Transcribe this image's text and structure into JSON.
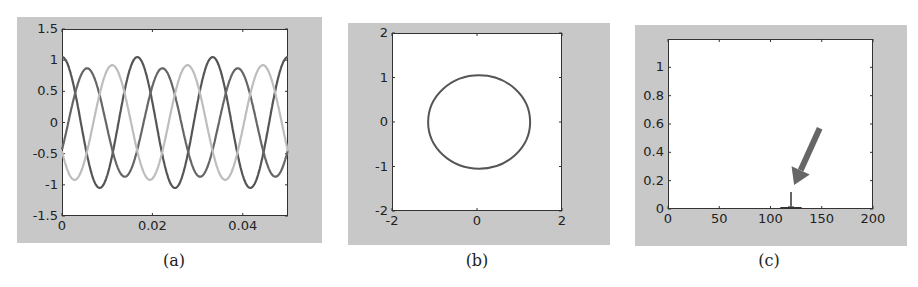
{
  "chart_data": [
    {
      "id": "a",
      "type": "line",
      "caption": "(a)",
      "title": "",
      "xlabel": "",
      "ylabel": "",
      "xlim": [
        0,
        0.05
      ],
      "ylim": [
        -1.5,
        1.5
      ],
      "x_ticks": [
        "0",
        "0.02",
        "0.04"
      ],
      "x_tick_values": [
        0,
        0.02,
        0.04
      ],
      "y_ticks": [
        "1.5",
        "1",
        "0.5",
        "0",
        "-0.5",
        "-1",
        "-1.5"
      ],
      "y_tick_values": [
        1.5,
        1,
        0.5,
        0,
        -0.5,
        -1,
        -1.5
      ],
      "grid": false,
      "series": [
        {
          "name": "phase 1",
          "color": "#555555",
          "amplitude": 1.05,
          "frequency_hz": 60,
          "phase_deg": 0
        },
        {
          "name": "phase 2",
          "color": "#666666",
          "amplitude": 0.87,
          "frequency_hz": 60,
          "phase_deg": -120
        },
        {
          "name": "phase 3",
          "color": "#bdbdbd",
          "amplitude": 0.92,
          "frequency_hz": 60,
          "phase_deg": 120
        }
      ]
    },
    {
      "id": "b",
      "type": "line",
      "caption": "(b)",
      "title": "",
      "xlabel": "",
      "ylabel": "",
      "xlim": [
        -2,
        2
      ],
      "ylim": [
        -2,
        2
      ],
      "x_ticks": [
        "-2",
        "0",
        "2"
      ],
      "x_tick_values": [
        -2,
        0,
        2
      ],
      "y_ticks": [
        "2",
        "1",
        "0",
        "-1",
        "-2"
      ],
      "y_tick_values": [
        2,
        1,
        0,
        -1,
        -2
      ],
      "grid": false,
      "series": [
        {
          "name": "trajectory",
          "color": "#555555",
          "shape": "ellipse",
          "center": [
            0.05,
            0
          ],
          "radius_x": 1.2,
          "radius_y": 1.05
        }
      ]
    },
    {
      "id": "c",
      "type": "bar",
      "caption": "(c)",
      "title": "",
      "xlabel": "",
      "ylabel": "",
      "xlim": [
        0,
        200
      ],
      "ylim": [
        0,
        1.2
      ],
      "x_ticks": [
        "0",
        "50",
        "100",
        "150",
        "200"
      ],
      "x_tick_values": [
        0,
        50,
        100,
        150,
        200
      ],
      "y_ticks": [
        "1",
        "0.8",
        "0.6",
        "0.4",
        "0.2",
        "0"
      ],
      "y_tick_values": [
        1,
        0.8,
        0.6,
        0.4,
        0.2,
        0
      ],
      "grid": false,
      "series": [
        {
          "name": "spectrum",
          "color": "#333333",
          "x": [
            110,
            115,
            118,
            120,
            122,
            125,
            130
          ],
          "values": [
            0.01,
            0.01,
            0.02,
            0.12,
            0.02,
            0.01,
            0.01
          ]
        }
      ],
      "annotations": [
        {
          "type": "arrow",
          "color": "#666666",
          "from": [
            148,
            0.57
          ],
          "to": [
            123,
            0.17
          ],
          "points_to": "peak at 120"
        }
      ]
    }
  ],
  "captions": [
    "(a)",
    "(b)",
    "(c)"
  ]
}
